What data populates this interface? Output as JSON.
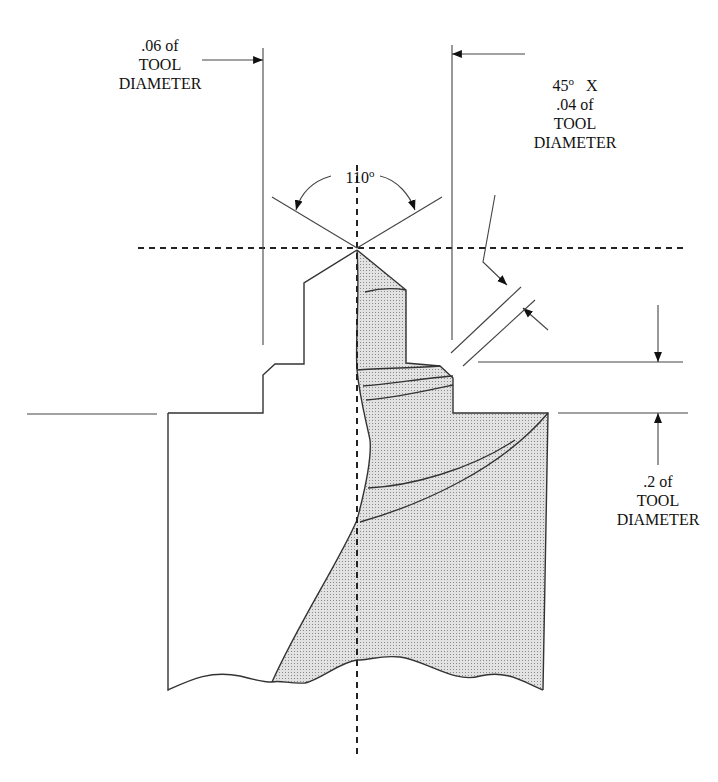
{
  "diagram": {
    "title_partial": "Tool Drill Point Geometry (partially cropped)",
    "labels": {
      "land_width": {
        "line1": ".06 of",
        "line2": "TOOL",
        "line3": "DIAMETER"
      },
      "chamfer": {
        "angle": "45",
        "degree": "o",
        "x": "X",
        "line2": ".04 of",
        "line3": "TOOL",
        "line4": "DIAMETER"
      },
      "point_angle": {
        "value": "110",
        "degree": "o"
      },
      "step_length": {
        "line1": ".2  of",
        "line2": "TOOL",
        "line3": "DIAMETER"
      }
    },
    "colors": {
      "line": "#333333",
      "fill": "#d4d4d4",
      "background": "#ffffff"
    }
  }
}
